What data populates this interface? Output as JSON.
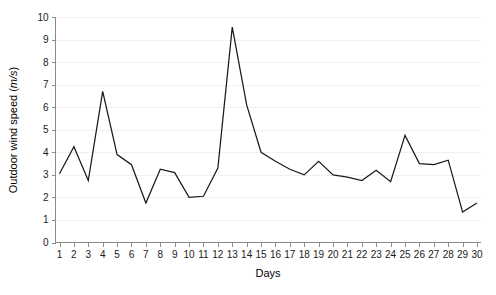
{
  "chart_data": {
    "type": "line",
    "title": "",
    "xlabel": "Days",
    "ylabel": "Outdoor wind speed (m/s)",
    "ylabel_text": "Outdoor wind speed (",
    "ylabel_unit": "m/s",
    "ylabel_tail": ")",
    "xlim": [
      1,
      30
    ],
    "ylim": [
      0,
      10
    ],
    "grid": true,
    "legend": false,
    "legend_position": "none",
    "x_tick_labels": [
      "1",
      "2",
      "3",
      "4",
      "5",
      "6",
      "7",
      "8",
      "9",
      "10",
      "11",
      "12",
      "13",
      "14",
      "15",
      "16",
      "17",
      "18",
      "19",
      "20",
      "21",
      "22",
      "23",
      "24",
      "25",
      "26",
      "27",
      "28",
      "29",
      "30"
    ],
    "y_tick_labels": [
      "0",
      "1",
      "2",
      "3",
      "4",
      "5",
      "6",
      "7",
      "8",
      "9",
      "10"
    ],
    "y_ticks": [
      0,
      1,
      2,
      3,
      4,
      5,
      6,
      7,
      8,
      9,
      10
    ],
    "categories": [
      1,
      2,
      3,
      4,
      5,
      6,
      7,
      8,
      9,
      10,
      11,
      12,
      13,
      14,
      15,
      16,
      17,
      18,
      19,
      20,
      21,
      22,
      23,
      24,
      25,
      26,
      27,
      28,
      29,
      30
    ],
    "series": [
      {
        "name": "Outdoor wind speed",
        "color": "#1a1a1a",
        "values": [
          3.05,
          4.25,
          2.75,
          6.7,
          3.9,
          3.45,
          1.75,
          3.25,
          3.1,
          2.0,
          2.05,
          3.3,
          9.55,
          6.1,
          4.0,
          3.6,
          3.25,
          3.0,
          3.6,
          3.0,
          2.9,
          2.75,
          3.2,
          2.7,
          4.75,
          3.5,
          3.45,
          3.65,
          1.35,
          1.75
        ]
      }
    ]
  }
}
